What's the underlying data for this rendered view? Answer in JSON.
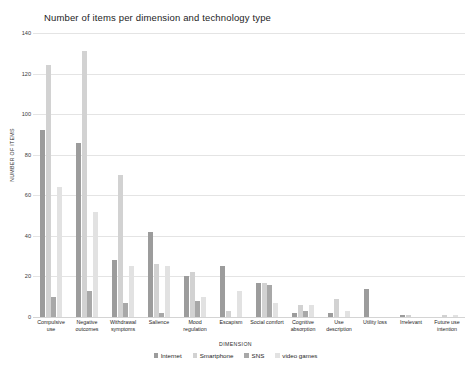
{
  "chart_data": {
    "type": "bar",
    "title": "Number of items per dimension and technology type",
    "xlabel": "DIMENSION",
    "ylabel": "NUMBER OF ITEMS",
    "ylim": [
      0,
      140
    ],
    "yticks": [
      0,
      20,
      40,
      60,
      80,
      100,
      120,
      140
    ],
    "grid": true,
    "legend_position": "bottom",
    "categories": [
      "Compulsive use",
      "Negative outcomes",
      "Withdrawal symptoms",
      "Salience",
      "Mood regulation",
      "Escapism",
      "Social comfort",
      "Cognitive absorption",
      "Use description",
      "Utility loss",
      "Irrelevant",
      "Future use intention"
    ],
    "series": [
      {
        "name": "Internet",
        "color": "#9c9c9c",
        "values": [
          92,
          86,
          28,
          42,
          20,
          25,
          17,
          2,
          2,
          14,
          1,
          0
        ]
      },
      {
        "name": "Smartphone",
        "color": "#d2d2d2",
        "values": [
          124,
          131,
          70,
          26,
          22,
          3,
          17,
          6,
          9,
          0,
          1,
          1
        ]
      },
      {
        "name": "SNS",
        "color": "#a8a8a8",
        "values": [
          10,
          13,
          7,
          2,
          8,
          0,
          16,
          3,
          0,
          0,
          0,
          0
        ]
      },
      {
        "name": "video games",
        "color": "#e2e2e2",
        "values": [
          64,
          52,
          25,
          25,
          10,
          13,
          7,
          6,
          3,
          0,
          0,
          1
        ]
      }
    ]
  }
}
